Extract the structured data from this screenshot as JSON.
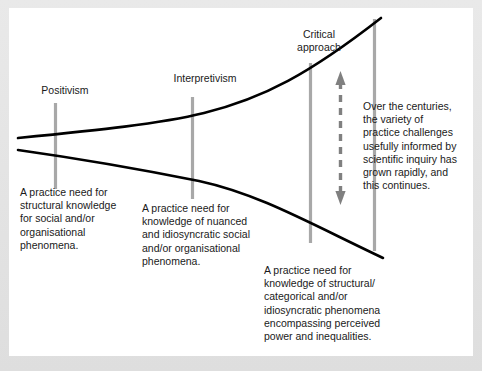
{
  "diagram": {
    "title_present": false,
    "background_color": "#ffffff",
    "frame_color": "#dedede",
    "curve_color": "#000000",
    "marker_line_color": "#a8a8a8",
    "arrow_color": "#808080",
    "text_color": "#1a1a1a",
    "markers": [
      {
        "id": "positivism",
        "label": "Positivism"
      },
      {
        "id": "interpretivism",
        "label": "Interpretivism"
      },
      {
        "id": "critical",
        "label": "Critical\napproach"
      }
    ],
    "notes": [
      {
        "id": "positivism-note",
        "text": "A practice need for\nstructural knowledge\nfor social and/or\norganisational\nphenomena."
      },
      {
        "id": "interpretivism-note",
        "text": "A practice need for\nknowledge of nuanced\nand idiosyncratic social\nand/or organisational\nphenomena."
      },
      {
        "id": "critical-note",
        "text": "A practice need for\nknowledge of structural/\ncategorical and/or\nidiosyncratic phenomena\nencompassing perceived\npower and inequalities."
      },
      {
        "id": "arrow-note",
        "text": "Over the centuries,\nthe variety of\npractice challenges\nusefully informed by\nscientific inquiry has\ngrown rapidly, and\nthis continues."
      }
    ],
    "arrow": {
      "id": "variety-range-arrow",
      "style": "dashed double-headed vertical"
    }
  }
}
